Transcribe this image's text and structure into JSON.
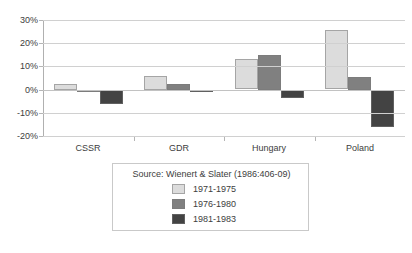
{
  "chart_data": {
    "type": "bar",
    "title": "",
    "subtitle": "",
    "xlabel": "",
    "ylabel": "",
    "categories": [
      "CSSR",
      "GDR",
      "Hungary",
      "Poland"
    ],
    "series": [
      {
        "name": "1971-1975",
        "color": "#dcdcdc",
        "values": [
          2.5,
          6.0,
          13.0,
          25.5
        ]
      },
      {
        "name": "1976-1980",
        "color": "#808080",
        "values": [
          -0.5,
          2.5,
          15.0,
          5.5
        ]
      },
      {
        "name": "1981-1983",
        "color": "#434343",
        "values": [
          -6.0,
          -0.5,
          -3.5,
          -16.0
        ]
      }
    ],
    "ylim": [
      -20,
      30
    ],
    "ytick_values": [
      30,
      20,
      10,
      0,
      -10,
      -20
    ],
    "ytick_labels": [
      "30%",
      "20%",
      "10%",
      "0%",
      "-10%",
      "-20%"
    ],
    "grid": true,
    "legend_position": "bottom"
  },
  "legend": {
    "source_text": "Source:  Wienert & Slater (1986:406-09)",
    "entries": [
      {
        "label": "1971-1975"
      },
      {
        "label": "1976-1980"
      },
      {
        "label": "1981-1983"
      }
    ]
  }
}
